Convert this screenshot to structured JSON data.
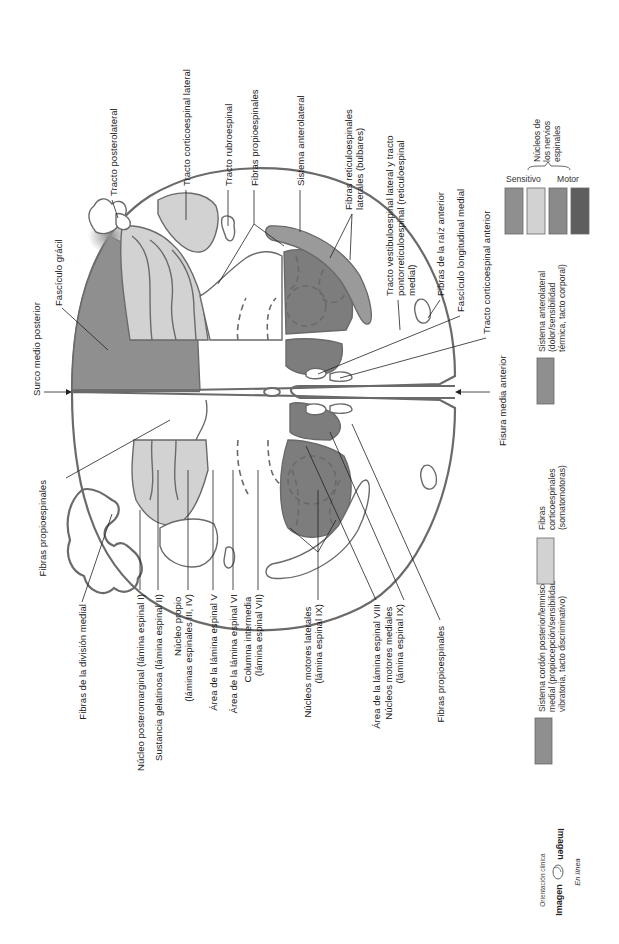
{
  "colors": {
    "sensory_dark": "#8f8f8f",
    "sensory_light": "#d2d2d2",
    "motor_medium": "#8a8a8a",
    "motor_dark": "#5e5e5e",
    "outline": "#6a6a6a",
    "white_matter": "#ffffff"
  },
  "labels": {
    "surco_medio_posterior": "Surco medio posterior",
    "fasciculo_gracil": "Fascículo grácil",
    "tracto_posterolateral": "Tracto posterolateral",
    "tracto_corticoespinal_lateral": "Tracto corticoespinal lateral",
    "tracto_rubroespinal": "Tracto rubroespinal",
    "fibras_propioespinales_top": "Fibras propioespinales",
    "sistema_anterolateral": "Sistema anterolateral",
    "fibras_reticuloespinales": [
      "Fibras reticuloespinales",
      "laterales (bulbares)"
    ],
    "tracto_vestibuloespinal": [
      "Tracto vestibuloespinal lateral y tracto",
      "pontorreticuloespinal (reticuloespinal",
      "medial)"
    ],
    "fibras_raiz_anterior": "Fibras de la raíz anterior",
    "fasciculo_longitudinal_medial": "Fascículo longitudinal medial",
    "tracto_corticoespinal_anterior": "Tracto corticoespinal anterior",
    "fisura_media_anterior": "Fisura media anterior",
    "fibras_propioespinales_left": "Fibras propioespinales",
    "fibras_division_medial": "Fibras de la división medial",
    "nucleo_posteromarginal": "Núcleo posteromarginal (lámina espinal I)",
    "sustancia_gelatinosa": "Sustancia gelatinosa (lámina espinal II)",
    "nucleo_propio": [
      "Núcleo propio",
      "(láminas espinales III, IV)"
    ],
    "lamina_v": "Área de la lámina espinal V",
    "lamina_vi": "Área de la lámina espinal VI",
    "columna_intermedia": [
      "Columna intermedia",
      "(lámina espinal VII)"
    ],
    "nucleos_motores_laterales": [
      "Núcleos motores laterales",
      "(lámina espinal IX)"
    ],
    "lamina_viii": "Área de la lámina espinal VIII",
    "nucleos_motores_mediales": [
      "Núcleos motores mediales",
      "(lámina espinal IX)"
    ],
    "fibras_propioespinales_bottom": "Fibras propioespinales"
  },
  "legend": {
    "nuclei_group_title": [
      "Núcleos de",
      "los nervios",
      "espinales"
    ],
    "sensitivo": "Sensitivo",
    "motor": "Motor",
    "items": [
      {
        "label": [
          "Sistema cordón posterior/lemnisco",
          "medial (propiocepción/sensibilidad",
          "vibratoria, tacto discriminativo)"
        ],
        "color": "#8f8f8f"
      },
      {
        "label": [
          "Fibras",
          "corticoespinales",
          "(somatomotoras)"
        ],
        "color": "#d2d2d2"
      },
      {
        "label": [
          "Sistema anterolateral",
          "(dolor/sensibilidad",
          "térmica, tacto corporal)"
        ],
        "color": "#8f8f8f"
      }
    ]
  },
  "brand": {
    "subtitle": "Orientación clínica",
    "name": "Imagen",
    "name_mirrored": "Imagen",
    "tagline": "En línea",
    "icon": "head-profile-icon"
  }
}
